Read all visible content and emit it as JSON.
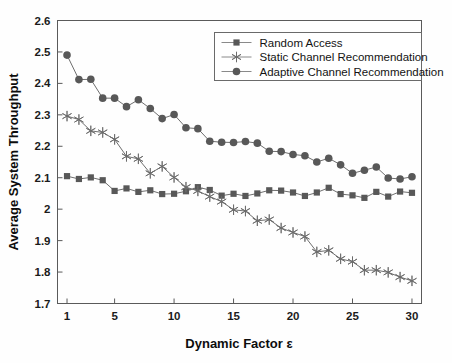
{
  "chart_data": {
    "type": "line",
    "title": "",
    "xlabel": "Dynamic Factor ε",
    "ylabel": "Average System Throughput",
    "xlim": [
      0.2,
      30.8
    ],
    "ylim": [
      1.7,
      2.6
    ],
    "xticks": [
      1,
      5,
      10,
      15,
      20,
      25,
      30
    ],
    "xtick_labels": [
      "1",
      "5",
      "10",
      "15",
      "20",
      "25",
      "30"
    ],
    "yticks": [
      1.7,
      1.8,
      1.9,
      2.0,
      2.1,
      2.2,
      2.3,
      2.4,
      2.5,
      2.6
    ],
    "ytick_labels": [
      "1.7",
      "1.8",
      "1.9",
      "2",
      "2.1",
      "2.2",
      "2.3",
      "2.4",
      "2.5",
      "2.6"
    ],
    "grid": false,
    "legend_position": "top-right",
    "x": [
      1,
      2,
      3,
      4,
      5,
      6,
      7,
      8,
      9,
      10,
      11,
      12,
      13,
      14,
      15,
      16,
      17,
      18,
      19,
      20,
      21,
      22,
      23,
      24,
      25,
      26,
      27,
      28,
      29,
      30
    ],
    "series": [
      {
        "name": "Random Access",
        "marker": "square",
        "color": "#585858",
        "values": [
          2.105,
          2.096,
          2.101,
          2.092,
          2.058,
          2.066,
          2.055,
          2.06,
          2.048,
          2.049,
          2.057,
          2.07,
          2.061,
          2.043,
          2.049,
          2.042,
          2.05,
          2.06,
          2.059,
          2.053,
          2.042,
          2.053,
          2.068,
          2.048,
          2.044,
          2.036,
          2.055,
          2.04,
          2.056,
          2.052
        ]
      },
      {
        "name": "Static Channel Recommendation",
        "marker": "star",
        "color": "#6b6b6b",
        "values": [
          2.296,
          2.285,
          2.249,
          2.244,
          2.222,
          2.168,
          2.16,
          2.114,
          2.136,
          2.101,
          2.07,
          2.058,
          2.04,
          2.024,
          1.998,
          1.994,
          1.963,
          1.967,
          1.94,
          1.926,
          1.913,
          1.864,
          1.869,
          1.842,
          1.833,
          1.806,
          1.806,
          1.799,
          1.784,
          1.772
        ]
      },
      {
        "name": "Adaptive Channel Recommendation",
        "marker": "circle",
        "color": "#585858",
        "values": [
          2.49,
          2.412,
          2.413,
          2.353,
          2.353,
          2.326,
          2.348,
          2.32,
          2.288,
          2.301,
          2.259,
          2.256,
          2.216,
          2.213,
          2.212,
          2.215,
          2.21,
          2.184,
          2.183,
          2.174,
          2.17,
          2.15,
          2.162,
          2.141,
          2.114,
          2.124,
          2.134,
          2.099,
          2.096,
          2.103
        ]
      }
    ]
  },
  "axes": {
    "x_title": "Dynamic Factor ε",
    "y_title": "Average System Throughput"
  },
  "legend": {
    "entries": [
      {
        "label": "Random Access"
      },
      {
        "label": "Static Channel Recommendation"
      },
      {
        "label": "Adaptive Channel Recommendation"
      }
    ]
  }
}
